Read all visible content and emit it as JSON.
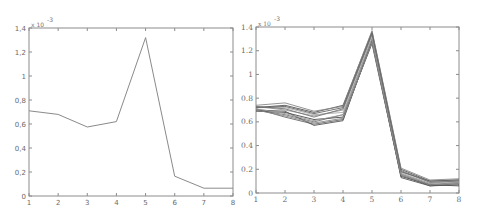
{
  "chart_data": [
    {
      "type": "line",
      "title": "",
      "xlabel": "",
      "ylabel": "",
      "x": [
        1,
        2,
        3,
        4,
        5,
        6,
        7,
        8
      ],
      "series": [
        {
          "name": "series-1",
          "values": [
            0.00071,
            0.00068,
            0.000575,
            0.00062,
            0.00132,
            0.000165,
            6.5e-05,
            6.5e-05
          ]
        }
      ],
      "xlim": [
        1,
        8
      ],
      "ylim": [
        0,
        0.0014
      ],
      "x_ticks": [
        "1",
        "2",
        "3",
        "4",
        "5",
        "6",
        "7",
        "8"
      ],
      "y_ticks": [
        "0",
        "0,2",
        "0,4",
        "0,6",
        "0,8",
        "1",
        "1,2",
        "1,4"
      ],
      "y_scale_label": "x 10",
      "y_scale_exponent": "-3",
      "grid": false,
      "line_color": "#8a8a8a"
    },
    {
      "type": "line",
      "title": "",
      "xlabel": "",
      "ylabel": "",
      "x": [
        1,
        2,
        3,
        4,
        5,
        6,
        7,
        8
      ],
      "series": [
        {
          "name": "run-1",
          "values": [
            0.00072,
            0.00074,
            0.00068,
            0.00074,
            0.00136,
            0.0002,
            0.0001,
            0.00011
          ]
        },
        {
          "name": "run-2",
          "values": [
            0.0007,
            0.00066,
            0.0006,
            0.00066,
            0.0013,
            0.00016,
            7e-05,
            9e-05
          ]
        },
        {
          "name": "run-3",
          "values": [
            0.00073,
            0.0007,
            0.00065,
            0.0007,
            0.00133,
            0.00018,
            9e-05,
            0.0001
          ]
        },
        {
          "name": "run-4",
          "values": [
            0.00071,
            0.00064,
            0.00058,
            0.00062,
            0.00128,
            0.00015,
            6e-05,
            8e-05
          ]
        },
        {
          "name": "run-5",
          "values": [
            0.00074,
            0.00076,
            0.00069,
            0.00073,
            0.00137,
            0.00021,
            0.00011,
            0.00012
          ]
        },
        {
          "name": "run-6",
          "values": [
            0.00069,
            0.00068,
            0.00062,
            0.00064,
            0.00126,
            0.00014,
            7e-05,
            6e-05
          ]
        },
        {
          "name": "run-7",
          "values": [
            0.00072,
            0.00072,
            0.00066,
            0.00068,
            0.00131,
            0.00017,
            8e-05,
            0.00011
          ]
        },
        {
          "name": "run-8",
          "values": [
            0.0007,
            0.00069,
            0.00057,
            0.00061,
            0.00129,
            0.00013,
            6e-05,
            7e-05
          ]
        },
        {
          "name": "run-9",
          "values": [
            0.00073,
            0.00071,
            0.00064,
            0.00071,
            0.00134,
            0.00019,
            9e-05,
            0.0001
          ]
        },
        {
          "name": "run-10",
          "values": [
            0.00071,
            0.00067,
            0.00061,
            0.00066,
            0.0013,
            0.00016,
            8e-05,
            9e-05
          ]
        },
        {
          "name": "run-11",
          "values": [
            0.00072,
            0.00073,
            0.00067,
            0.00072,
            0.00135,
            0.00018,
            0.0001,
            0.00011
          ]
        },
        {
          "name": "run-12",
          "values": [
            0.0007,
            0.00065,
            0.00059,
            0.00063,
            0.00127,
            0.00015,
            7e-05,
            8e-05
          ]
        }
      ],
      "xlim": [
        1,
        8
      ],
      "ylim": [
        0,
        0.0014
      ],
      "x_ticks": [
        "1",
        "2",
        "3",
        "4",
        "5",
        "6",
        "7",
        "8"
      ],
      "y_ticks": [
        "0",
        "0.2",
        "0.4",
        "0.6",
        "0.8",
        "1",
        "1.2",
        "1.4"
      ],
      "y_scale_label": "x 10",
      "y_scale_exponent": "-3",
      "grid": false,
      "line_colors": [
        "#555555",
        "#777777",
        "#999999",
        "#666666",
        "#888888",
        "#4a4a4a",
        "#aaaaaa"
      ]
    }
  ],
  "layout": [
    {
      "left": 29,
      "top": 28,
      "right": 233,
      "bottom": 196
    },
    {
      "left": 16,
      "top": 27,
      "right": 219,
      "bottom": 193
    }
  ]
}
